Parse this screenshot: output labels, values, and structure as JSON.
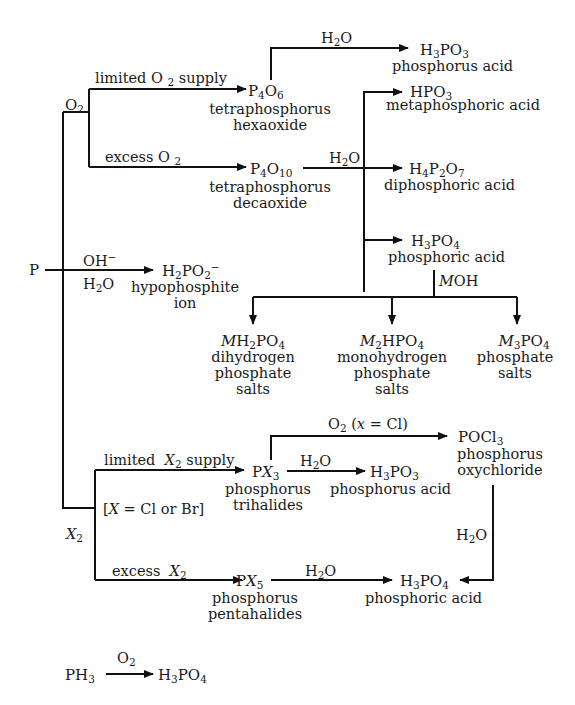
{
  "nodes": {
    "p": {
      "formula": "P"
    },
    "o2_branch": {
      "label": "O2"
    },
    "x2_branch": {
      "label": "X2"
    },
    "p4o6": {
      "formula": "P4O6",
      "name_line1": "tetraphosphorus",
      "name_line2": "hexaoxide"
    },
    "p4o10": {
      "formula": "P4O10",
      "name_line1": "tetraphosphorus",
      "name_line2": "decaoxide"
    },
    "h3po3_top": {
      "formula": "H3PO3",
      "name": "phosphorus acid"
    },
    "hpo3": {
      "formula": "HPO3",
      "name": "metaphosphoric acid"
    },
    "h4p2o7": {
      "formula": "H4P2O7",
      "name": "diphosphoric acid"
    },
    "h3po4_mid": {
      "formula": "H3PO4",
      "name": "phosphoric acid"
    },
    "h2po2": {
      "formula": "H2PO2−",
      "name_line1": "hypophosphite",
      "name_line2": "ion"
    },
    "mh2po4": {
      "formula": "MH2PO4",
      "name_line1": "dihydrogen",
      "name_line2": "phosphate",
      "name_line3": "salts"
    },
    "m2hpo4": {
      "formula": "M2HPO4",
      "name_line1": "monohydrogen",
      "name_line2": "phosphate",
      "name_line3": "salts"
    },
    "m3po4": {
      "formula": "M3PO4",
      "name_line1": "phosphate",
      "name_line2": "salts"
    },
    "px3": {
      "formula": "PX3",
      "name_line1": "phosphorus",
      "name_line2": "trihalides"
    },
    "h3po3_bottom": {
      "formula": "H3PO3",
      "name": "phosphorus acid"
    },
    "pocl3": {
      "formula": "POCl3",
      "name_line1": "phosphorus",
      "name_line2": "oxychloride"
    },
    "px5": {
      "formula": "PX5",
      "name_line1": "phosphorus",
      "name_line2": "pentahalides"
    },
    "h3po4_bottom": {
      "formula": "H3PO4",
      "name": "phosphoric acid"
    },
    "ph3": {
      "formula": "PH3"
    },
    "h3po4_ph3": {
      "formula": "H3PO4"
    }
  },
  "conditions": {
    "limited_o2": "limited O2 supply",
    "excess_o2": "excess O2",
    "h2o_p4o6": "H2O",
    "h2o_p4o10": "H2O",
    "oh_minus": "OH−",
    "h2o_hypo": "H2O",
    "moh": "MOH",
    "limited_x2": "limited X2 supply",
    "x_note": "[X = Cl or Br]",
    "excess_x2": "excess X2",
    "o2_x_cl": "O2 (x = Cl)",
    "h2o_px3": "H2O",
    "h2o_pocl3": "H2O",
    "h2o_px5": "H2O",
    "o2_ph3": "O2"
  }
}
